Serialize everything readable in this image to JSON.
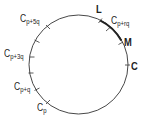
{
  "diagram": {
    "type": "circle-with-marked-points",
    "circle": {
      "cx": 78.5,
      "cy": 64.5,
      "r": 49.5,
      "stroke": "#333333"
    },
    "highlighted_arc": {
      "from": "L",
      "to": "M",
      "stroke_width": 2
    },
    "points": [
      {
        "id": "L",
        "label": "L",
        "sub": "",
        "x": 100,
        "y": 21
      },
      {
        "id": "Cprq",
        "label": "C",
        "sub": "p+rq",
        "x": 108,
        "y": 29
      },
      {
        "id": "M",
        "label": "M",
        "sub": "",
        "x": 121,
        "y": 43
      },
      {
        "id": "C",
        "label": "C",
        "sub": "",
        "x": 127,
        "y": 65
      },
      {
        "id": "Cp5q",
        "label": "C",
        "sub": "p+5q",
        "x": 48,
        "y": 27
      },
      {
        "id": "u1",
        "label": "",
        "sub": "",
        "x": 37,
        "y": 41
      },
      {
        "id": "Cp3q",
        "label": "C",
        "sub": "p+3q",
        "x": 32,
        "y": 57
      },
      {
        "id": "u2",
        "label": "",
        "sub": "",
        "x": 31,
        "y": 73
      },
      {
        "id": "Cpq",
        "label": "C",
        "sub": "p+q",
        "x": 37,
        "y": 89
      },
      {
        "id": "Cp",
        "label": "C",
        "sub": "p",
        "x": 48,
        "y": 102
      }
    ]
  },
  "labels": {
    "L": "L",
    "M": "M",
    "C": "C",
    "Cprq_main": "C",
    "Cprq_sub": "p+rq",
    "Cp5q_main": "C",
    "Cp5q_sub": "p+5q",
    "Cp3q_main": "C",
    "Cp3q_sub": "p+3q",
    "Cpq_main": "C",
    "Cpq_sub": "p+q",
    "Cp_main": "C",
    "Cp_sub": "p"
  }
}
